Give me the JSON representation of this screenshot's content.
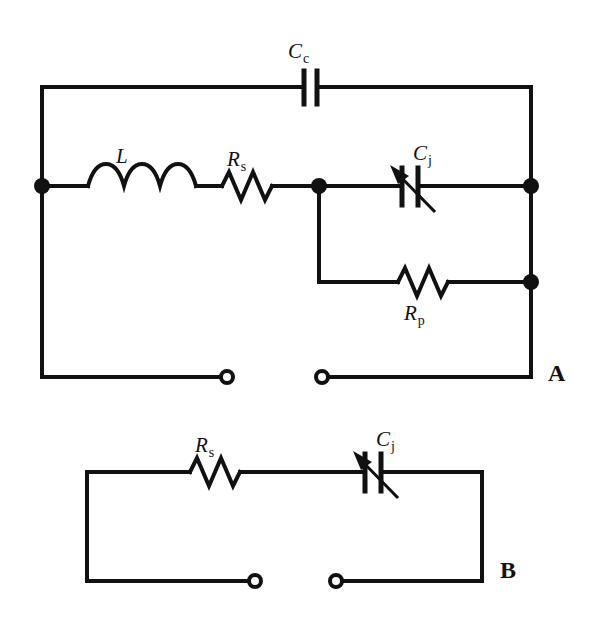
{
  "figure": {
    "background_color": "#ffffff",
    "line_color": "#111111"
  },
  "panels": [
    {
      "id": "A",
      "label": "A",
      "components": [
        {
          "id": "Cc",
          "type": "capacitor",
          "symbol": "fixed-capacitor",
          "label_base": "C",
          "label_sub": "c",
          "label_text": "Cc",
          "branch": "top-rail"
        },
        {
          "id": "L",
          "type": "inductor",
          "symbol": "coil-inductor",
          "label_base": "L",
          "label_sub": "",
          "label_text": "L",
          "branch": "middle-rail"
        },
        {
          "id": "Rs",
          "type": "resistor",
          "symbol": "zigzag-resistor",
          "label_base": "R",
          "label_sub": "s",
          "label_text": "Rs",
          "branch": "middle-rail"
        },
        {
          "id": "Cj",
          "type": "variable-capacitor",
          "symbol": "variable-capacitor-with-arrow",
          "label_base": "C",
          "label_sub": "j",
          "label_text": "Cj",
          "branch": "middle-rail"
        },
        {
          "id": "Rp",
          "type": "resistor",
          "symbol": "zigzag-resistor",
          "label_base": "R",
          "label_sub": "p",
          "label_text": "Rp",
          "branch": "parallel-branch"
        }
      ],
      "nodes": 4,
      "terminals": 2
    },
    {
      "id": "B",
      "label": "B",
      "components": [
        {
          "id": "Rs",
          "type": "resistor",
          "symbol": "zigzag-resistor",
          "label_base": "R",
          "label_sub": "s",
          "label_text": "Rs",
          "branch": "top-rail"
        },
        {
          "id": "Cj",
          "type": "variable-capacitor",
          "symbol": "variable-capacitor-with-arrow",
          "label_base": "C",
          "label_sub": "j",
          "label_text": "Cj",
          "branch": "top-rail"
        }
      ],
      "nodes": 0,
      "terminals": 2
    }
  ]
}
